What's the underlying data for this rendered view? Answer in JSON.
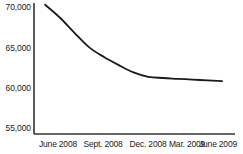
{
  "chart_data": {
    "type": "line",
    "title": "",
    "subtitle": "",
    "xlabel": "",
    "ylabel": "",
    "categories": [
      "June 2008",
      "Sept. 2008",
      "Dec. 2008",
      "Mar. 2009",
      "June 2009"
    ],
    "x_tick_labels": [
      "June 2008",
      "Sept. 2008",
      "Dec. 2008",
      "Mar. 2009",
      "June 2009"
    ],
    "y_tick_labels": [
      "70,000",
      "65,000",
      "60,000",
      "55,000"
    ],
    "y_ticks": [
      70000,
      65000,
      60000,
      55000
    ],
    "ylim": [
      55000,
      70500
    ],
    "grid": false,
    "legend": null,
    "legend_position": "none",
    "annotations": [],
    "series": [
      {
        "name": "Value",
        "values": [
          70300,
          65000,
          61900,
          61100,
          60800
        ],
        "detail_points": [
          {
            "x": "June 2008",
            "y": 70300
          },
          {
            "x": "Jul 2008",
            "y": 68700
          },
          {
            "x": "Aug 2008",
            "y": 66800
          },
          {
            "x": "Sept. 2008",
            "y": 65000
          },
          {
            "x": "Oct 2008",
            "y": 63800
          },
          {
            "x": "Nov 2008",
            "y": 62800
          },
          {
            "x": "Dec. 2008",
            "y": 61900
          },
          {
            "x": "Jan 2009",
            "y": 61350
          },
          {
            "x": "Feb 2009",
            "y": 61200
          },
          {
            "x": "Mar. 2009",
            "y": 61100
          },
          {
            "x": "Apr 2009",
            "y": 61000
          },
          {
            "x": "May 2009",
            "y": 60900
          },
          {
            "x": "June 2009",
            "y": 60800
          }
        ],
        "color": "#1a1a1a",
        "line_width": 1.8,
        "markers": false
      }
    ],
    "axes": {
      "y_axis_visible": true,
      "x_axis_visible": true,
      "axis_color": "#333333",
      "ticks_visible": false
    }
  },
  "layout": {
    "plot_left_px": 34,
    "plot_right_px": 235,
    "plot_top_px": 3,
    "plot_bottom_px": 134,
    "y_label_positions_px": [
      7,
      48,
      88,
      128
    ],
    "x_label_positions_px": [
      58,
      103,
      148,
      187,
      218
    ]
  },
  "colors": {
    "background": "#ffffff",
    "line": "#1a1a1a",
    "axis": "#333333",
    "text": "#1a1a1a"
  }
}
